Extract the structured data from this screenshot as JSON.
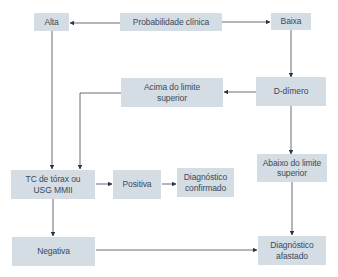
{
  "diagram": {
    "colors": {
      "box_fill": "#d4dce4",
      "text": "#3c4a5a",
      "line": "#5a5a66",
      "arrow": "#2e3448"
    },
    "nodes": {
      "alta": {
        "label": "Alta"
      },
      "probabilidade": {
        "label": "Probabilidade clínica"
      },
      "baixa": {
        "label": "Baixa"
      },
      "acima": {
        "label": "Acima do limite superior"
      },
      "ddimero": {
        "label": "D-dímero"
      },
      "tc": {
        "label": "TC de tórax ou USG MMII"
      },
      "positiva": {
        "label": "Positiva"
      },
      "confirmado": {
        "label": "Diagnóstico confirmado"
      },
      "abaixo": {
        "label": "Abaixo do limite superior"
      },
      "negativa": {
        "label": "Negativa"
      },
      "afastado": {
        "label": "Diagnóstico afastado"
      }
    },
    "edges": [
      {
        "from": "probabilidade",
        "to": "alta"
      },
      {
        "from": "probabilidade",
        "to": "baixa"
      },
      {
        "from": "baixa",
        "to": "ddimero"
      },
      {
        "from": "ddimero",
        "to": "acima"
      },
      {
        "from": "ddimero",
        "to": "abaixo"
      },
      {
        "from": "alta",
        "to": "tc"
      },
      {
        "from": "acima",
        "to": "tc"
      },
      {
        "from": "tc",
        "to": "positiva"
      },
      {
        "from": "positiva",
        "to": "confirmado"
      },
      {
        "from": "tc",
        "to": "negativa"
      },
      {
        "from": "negativa",
        "to": "afastado"
      },
      {
        "from": "abaixo",
        "to": "afastado"
      }
    ]
  }
}
